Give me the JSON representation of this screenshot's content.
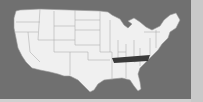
{
  "map": {
    "region": "United States",
    "highlighted_state": "Tennessee",
    "colors": {
      "background": "#707070",
      "state_fill": "#f0f0f0",
      "state_border": "#9a9a9a",
      "highlight_fill": "#3a3a3a",
      "side_strip": "#c9c9c9"
    }
  }
}
